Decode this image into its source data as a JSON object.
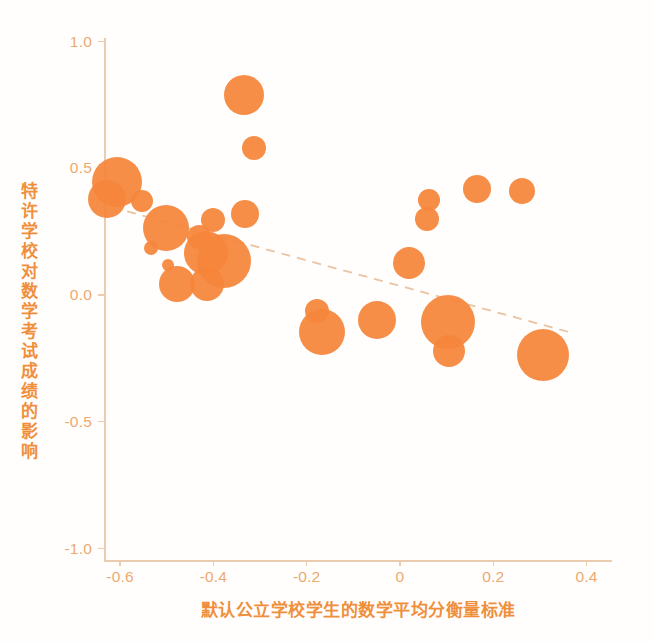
{
  "chart_data": {
    "type": "scatter",
    "title": "",
    "subtitle": "",
    "xlabel": "默认公立学校学生的数学平均分衡量标准",
    "ylabel": "特许学校对数学考试成绩的影响",
    "xlim": [
      -0.7,
      0.45
    ],
    "ylim": [
      -1.0,
      1.0
    ],
    "xticks": [
      "-0.6",
      "-0.4",
      "-0.2",
      "0",
      "0.2",
      "0.4"
    ],
    "xtick_values": [
      -0.6,
      -0.4,
      -0.2,
      0,
      0.2,
      0.4
    ],
    "yticks": [
      "1.0",
      "0.5",
      "0.0",
      "-0.5",
      "-1.0"
    ],
    "ytick_values": [
      1.0,
      0.5,
      0.0,
      -0.5,
      -1.0
    ],
    "grid": false,
    "legend": "none",
    "marker_color": "#f5853a",
    "axis_color": "#e9cdae",
    "tick_label_color": "#eca66a",
    "axis_title_color": "#ef8f3c",
    "size_encoding": "bubble radius proportional to sample weight",
    "points": [
      {
        "x": -0.607,
        "y": 0.445,
        "r": 25
      },
      {
        "x": -0.628,
        "y": 0.378,
        "r": 19
      },
      {
        "x": -0.552,
        "y": 0.37,
        "r": 11
      },
      {
        "x": -0.501,
        "y": 0.265,
        "r": 23
      },
      {
        "x": -0.534,
        "y": 0.185,
        "r": 7
      },
      {
        "x": -0.497,
        "y": 0.12,
        "r": 6
      },
      {
        "x": -0.479,
        "y": 0.045,
        "r": 18
      },
      {
        "x": -0.43,
        "y": 0.23,
        "r": 12
      },
      {
        "x": -0.416,
        "y": 0.165,
        "r": 22
      },
      {
        "x": -0.4,
        "y": 0.295,
        "r": 12
      },
      {
        "x": -0.414,
        "y": 0.045,
        "r": 17
      },
      {
        "x": -0.378,
        "y": 0.135,
        "r": 27
      },
      {
        "x": -0.334,
        "y": 0.79,
        "r": 20
      },
      {
        "x": -0.313,
        "y": 0.58,
        "r": 12
      },
      {
        "x": -0.333,
        "y": 0.32,
        "r": 14
      },
      {
        "x": -0.178,
        "y": -0.065,
        "r": 12
      },
      {
        "x": -0.167,
        "y": -0.145,
        "r": 23
      },
      {
        "x": -0.05,
        "y": -0.1,
        "r": 19
      },
      {
        "x": 0.019,
        "y": 0.125,
        "r": 16
      },
      {
        "x": 0.063,
        "y": 0.375,
        "r": 11
      },
      {
        "x": 0.058,
        "y": 0.3,
        "r": 12
      },
      {
        "x": 0.102,
        "y": -0.105,
        "r": 27
      },
      {
        "x": 0.106,
        "y": -0.222,
        "r": 16
      },
      {
        "x": 0.166,
        "y": 0.42,
        "r": 14
      },
      {
        "x": 0.262,
        "y": 0.41,
        "r": 13
      },
      {
        "x": 0.307,
        "y": -0.235,
        "r": 26
      }
    ],
    "trend_line": {
      "style": "dashed",
      "color": "#e9c3a2",
      "x_start": -0.585,
      "y_start": 0.33,
      "x_end": 0.37,
      "y_end": -0.15
    }
  }
}
